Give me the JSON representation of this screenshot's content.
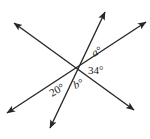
{
  "figure": {
    "type": "geometry-diagram",
    "background_color": "#ffffff",
    "line_color": "#262626",
    "text_color": "#1a1a1a",
    "canvas": {
      "width": 150,
      "height": 139
    },
    "intersection_point": {
      "x": 77,
      "y": 68
    },
    "lines": [
      {
        "name": "line-upper-left-to-lower-right",
        "from": {
          "x": 14,
          "y": 23
        },
        "to": {
          "x": 134,
          "y": 110
        },
        "arrow_start": true,
        "arrow_end": true
      },
      {
        "name": "line-upper-right-to-lower-left",
        "from": {
          "x": 146,
          "y": 22
        },
        "to": {
          "x": 7,
          "y": 113
        },
        "arrow_start": true,
        "arrow_end": true
      },
      {
        "name": "line-top-to-bottom",
        "from": {
          "x": 105,
          "y": 12
        },
        "to": {
          "x": 50,
          "y": 128
        },
        "arrow_start": true,
        "arrow_end": true
      }
    ],
    "labels": [
      {
        "name": "angle-label-a",
        "text": "a°",
        "style": "italic",
        "x": 94,
        "y": 57,
        "rotation": -28
      },
      {
        "name": "angle-label-34",
        "text": "34°",
        "style": "normal",
        "x": 88,
        "y": 74,
        "rotation": 0
      },
      {
        "name": "angle-label-b",
        "text": "b°",
        "style": "italic",
        "x": 75,
        "y": 89,
        "rotation": -22
      },
      {
        "name": "angle-label-20",
        "text": "20°",
        "style": "normal",
        "x": 52,
        "y": 97,
        "rotation": -30
      }
    ]
  }
}
